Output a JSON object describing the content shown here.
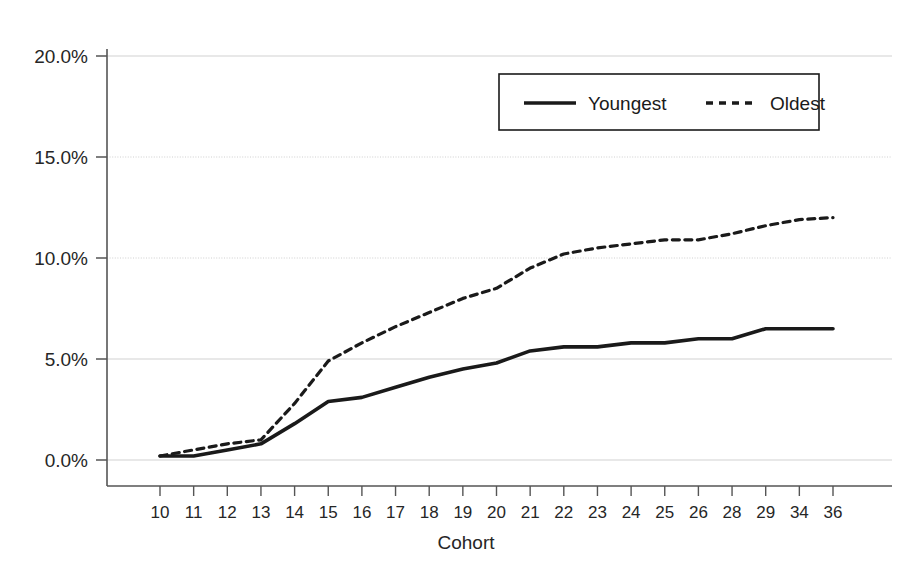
{
  "chart_data": {
    "type": "line",
    "title": "",
    "xlabel": "Cohort",
    "ylabel": "",
    "categories": [
      "10",
      "11",
      "12",
      "13",
      "14",
      "15",
      "16",
      "17",
      "18",
      "19",
      "20",
      "21",
      "22",
      "23",
      "24",
      "25",
      "26",
      "28",
      "29",
      "34",
      "36"
    ],
    "series": [
      {
        "name": "Youngest",
        "style": "solid",
        "color": "#1a1a1a",
        "values": [
          0.2,
          0.2,
          0.5,
          0.8,
          1.8,
          2.9,
          3.1,
          3.6,
          4.1,
          4.5,
          4.8,
          5.4,
          5.6,
          5.6,
          5.8,
          5.8,
          6.0,
          6.0,
          6.5,
          6.5,
          6.5
        ]
      },
      {
        "name": "Oldest",
        "style": "dashed",
        "color": "#1a1a1a",
        "values": [
          0.2,
          0.5,
          0.8,
          1.0,
          2.8,
          4.9,
          5.8,
          6.6,
          7.3,
          8.0,
          8.5,
          9.5,
          10.2,
          10.5,
          10.7,
          10.9,
          10.9,
          11.2,
          11.6,
          11.9,
          12.0
        ]
      }
    ],
    "ylim": [
      0,
      20
    ],
    "yticks": [
      0,
      5,
      10,
      15,
      20
    ],
    "ytick_labels": [
      "0.0%",
      "5.0%",
      "10.0%",
      "15.0%",
      "20.0%"
    ],
    "grid": true,
    "grid_axis": "y",
    "legend_position": "top-right",
    "value_unit": "percent"
  },
  "legend": {
    "entries": [
      {
        "label": "Youngest",
        "style": "solid"
      },
      {
        "label": "Oldest",
        "style": "dashed"
      }
    ]
  },
  "axes": {
    "x_title": "Cohort"
  },
  "colors": {
    "line": "#1a1a1a",
    "grid": "#c8c8c8",
    "axis": "#555555",
    "background": "#ffffff",
    "text": "#262626"
  }
}
